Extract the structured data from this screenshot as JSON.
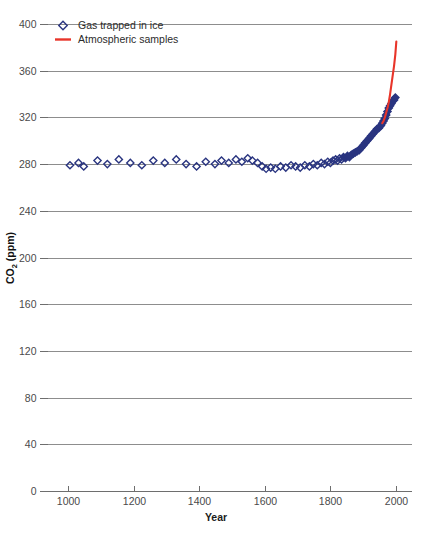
{
  "chart_data": {
    "type": "scatter",
    "title": "",
    "xlabel": "Year",
    "ylabel": "CO2 (ppm)",
    "ylabel_base": "CO",
    "ylabel_sub": "2",
    "ylabel_unit": " (ppm)",
    "xlim": [
      950,
      2030
    ],
    "ylim": [
      0,
      400
    ],
    "xticks": [
      1000,
      1200,
      1400,
      1600,
      1800,
      2000
    ],
    "yticks": [
      0,
      40,
      80,
      120,
      160,
      200,
      240,
      280,
      320,
      360,
      400
    ],
    "grid": true,
    "grid_axis": "y",
    "legend_position": "top-left",
    "colors": {
      "ice_marker": "#2a3580",
      "atmos_line": "#e8352a",
      "gridline": "#8d8d8d",
      "axis": "#6e6e6e",
      "text": "#3a3a3a"
    },
    "series": [
      {
        "name": "Gas trapped in ice",
        "marker": "open-diamond",
        "color": "#2a3580",
        "points": [
          [
            1006,
            279
          ],
          [
            1032,
            281
          ],
          [
            1048,
            278
          ],
          [
            1090,
            283
          ],
          [
            1120,
            280
          ],
          [
            1155,
            284
          ],
          [
            1190,
            281
          ],
          [
            1225,
            279
          ],
          [
            1260,
            283
          ],
          [
            1295,
            281
          ],
          [
            1330,
            284
          ],
          [
            1360,
            280
          ],
          [
            1392,
            278
          ],
          [
            1420,
            282
          ],
          [
            1448,
            280
          ],
          [
            1468,
            283
          ],
          [
            1490,
            281
          ],
          [
            1512,
            284
          ],
          [
            1530,
            282
          ],
          [
            1548,
            285
          ],
          [
            1562,
            283
          ],
          [
            1578,
            281
          ],
          [
            1592,
            278
          ],
          [
            1604,
            276
          ],
          [
            1618,
            277
          ],
          [
            1632,
            276
          ],
          [
            1648,
            278
          ],
          [
            1664,
            277
          ],
          [
            1680,
            279
          ],
          [
            1694,
            278
          ],
          [
            1708,
            277
          ],
          [
            1722,
            279
          ],
          [
            1736,
            278
          ],
          [
            1748,
            280
          ],
          [
            1760,
            279
          ],
          [
            1772,
            281
          ],
          [
            1782,
            280
          ],
          [
            1792,
            282
          ],
          [
            1800,
            281
          ],
          [
            1808,
            283
          ],
          [
            1816,
            284
          ],
          [
            1822,
            283
          ],
          [
            1828,
            285
          ],
          [
            1834,
            284
          ],
          [
            1840,
            286
          ],
          [
            1846,
            285
          ],
          [
            1852,
            287
          ],
          [
            1858,
            286
          ],
          [
            1864,
            288
          ],
          [
            1870,
            289
          ],
          [
            1876,
            290
          ],
          [
            1882,
            291
          ],
          [
            1888,
            292
          ],
          [
            1894,
            294
          ],
          [
            1900,
            296
          ],
          [
            1906,
            298
          ],
          [
            1912,
            300
          ],
          [
            1918,
            302
          ],
          [
            1924,
            304
          ],
          [
            1930,
            306
          ],
          [
            1936,
            308
          ],
          [
            1942,
            310
          ],
          [
            1948,
            311
          ],
          [
            1954,
            313
          ],
          [
            1958,
            315
          ],
          [
            1962,
            317
          ],
          [
            1966,
            319
          ],
          [
            1970,
            322
          ],
          [
            1974,
            325
          ],
          [
            1978,
            328
          ],
          [
            1982,
            330
          ],
          [
            1986,
            332
          ],
          [
            1990,
            334
          ],
          [
            1994,
            335
          ],
          [
            1998,
            337
          ]
        ]
      },
      {
        "name": "Atmospheric samples",
        "marker": "line",
        "color": "#e8352a",
        "points": [
          [
            1958,
            315
          ],
          [
            1962,
            317
          ],
          [
            1966,
            320
          ],
          [
            1970,
            324
          ],
          [
            1974,
            328
          ],
          [
            1978,
            333
          ],
          [
            1982,
            340
          ],
          [
            1986,
            348
          ],
          [
            1990,
            356
          ],
          [
            1994,
            364
          ],
          [
            1998,
            374
          ],
          [
            2001,
            385
          ]
        ]
      }
    ],
    "legend": [
      {
        "label": "Gas trapped in ice",
        "marker": "open-diamond",
        "color": "#2a3580"
      },
      {
        "label": "Atmospheric samples",
        "marker": "line",
        "color": "#e8352a"
      }
    ]
  }
}
